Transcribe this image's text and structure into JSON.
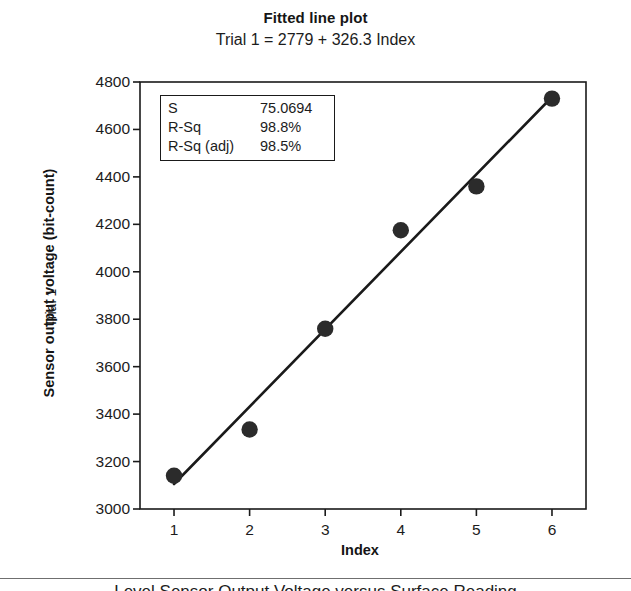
{
  "chart_data": {
    "type": "scatter",
    "title": "Fitted line plot",
    "subtitle": "Trial 1 = 2779 + 326.3 Index",
    "xlabel": "Index",
    "ylabel": "Sensor output voltage (bit-count)",
    "ylabel_secondary": "Trial 1",
    "x": [
      1,
      2,
      3,
      4,
      5,
      6
    ],
    "values": [
      3140,
      3335,
      3760,
      4175,
      4360,
      4730
    ],
    "series": [
      {
        "name": "Trial 1",
        "type": "scatter",
        "values": [
          3140,
          3335,
          3760,
          4175,
          4360,
          4730
        ]
      },
      {
        "name": "Fitted line",
        "type": "line",
        "intercept": 2779,
        "slope": 326.3,
        "values": [
          3105.3,
          3431.6,
          3757.9,
          4084.2,
          4410.5,
          4736.8
        ]
      }
    ],
    "xlim": [
      0.55,
      6.45
    ],
    "ylim": [
      3000,
      4800
    ],
    "xticks": [
      "1",
      "2",
      "3",
      "4",
      "5",
      "6"
    ],
    "yticks": [
      "3000",
      "3200",
      "3400",
      "3600",
      "3800",
      "4000",
      "4200",
      "4400",
      "4600",
      "4800"
    ],
    "grid": false,
    "legend": "none",
    "marker_color": "#2b2b2b",
    "line_color": "#1a1a1a",
    "frame_color": "#1a1a1a"
  },
  "stats_box": {
    "rows": [
      {
        "key": "S",
        "value": "75.0694"
      },
      {
        "key": "R-Sq",
        "value": "98.8%"
      },
      {
        "key": "R-Sq (adj)",
        "value": "98.5%"
      }
    ]
  },
  "bottom_caption": {
    "text": "Level Sensor Output Voltage versus Surface Reading"
  }
}
